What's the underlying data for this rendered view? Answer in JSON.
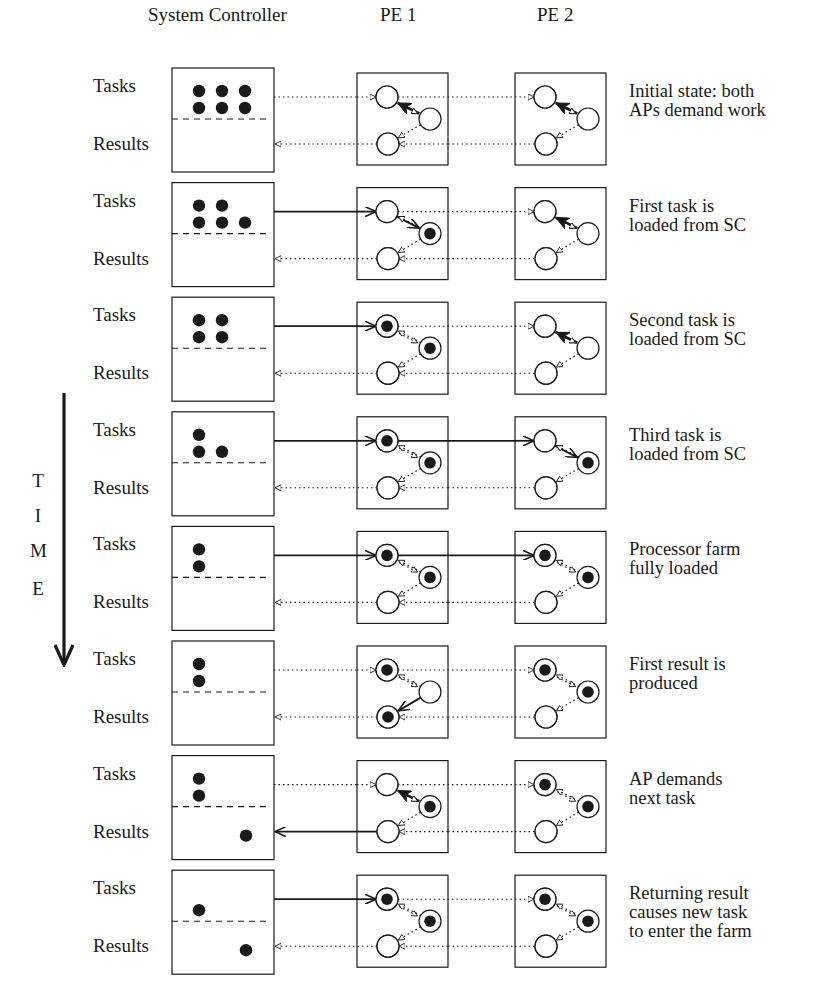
{
  "headers": {
    "system_controller": "System Controller",
    "pe1": "PE 1",
    "pe2": "PE 2"
  },
  "labels": {
    "tasks": "Tasks",
    "results": "Results"
  },
  "time_axis": {
    "letters": [
      "T",
      "I",
      "M",
      "E"
    ]
  },
  "colors": {
    "ink": "#1a1a1a",
    "background": "#ffffff"
  },
  "rows": [
    {
      "description": "Initial state: both\nAPs demand work",
      "sc_tasks": [
        [
          0,
          0
        ],
        [
          1,
          0
        ],
        [
          2,
          0
        ],
        [
          0,
          1
        ],
        [
          1,
          1
        ],
        [
          2,
          1
        ]
      ],
      "sc_results": [],
      "task_link": "dotted-pe1",
      "task_link_pe2": false,
      "result_link": "dotted",
      "pe1": {
        "in": "empty",
        "work": "empty",
        "out": "empty",
        "flow": "work-to-in"
      },
      "pe2": {
        "in": "empty",
        "work": "empty",
        "out": "empty",
        "flow": "work-to-in"
      }
    },
    {
      "description": "First task is\nloaded from SC",
      "sc_tasks": [
        [
          0,
          0
        ],
        [
          1,
          0
        ],
        [
          0,
          1
        ],
        [
          1,
          1
        ],
        [
          2,
          1
        ]
      ],
      "sc_results": [],
      "task_link": "solid-pe1",
      "task_link_pe2": false,
      "result_link": "dotted",
      "pe1": {
        "in": "empty",
        "work": "full",
        "out": "empty",
        "flow": "in-to-work"
      },
      "pe2": {
        "in": "empty",
        "work": "empty",
        "out": "empty",
        "flow": "work-to-in"
      }
    },
    {
      "description": "Second task is\nloaded from SC",
      "sc_tasks": [
        [
          0,
          0
        ],
        [
          1,
          0
        ],
        [
          0,
          1
        ],
        [
          1,
          1
        ]
      ],
      "sc_results": [],
      "task_link": "solid-pe1",
      "task_link_pe2": false,
      "result_link": "dotted",
      "pe1": {
        "in": "full",
        "work": "full",
        "out": "empty",
        "flow": "none"
      },
      "pe2": {
        "in": "empty",
        "work": "empty",
        "out": "empty",
        "flow": "work-to-in"
      }
    },
    {
      "description": "Third task is\nloaded from SC",
      "sc_tasks": [
        [
          0,
          0
        ],
        [
          0,
          1
        ],
        [
          1,
          1
        ]
      ],
      "sc_results": [],
      "task_link": "solid-pe1",
      "task_link_pe2": true,
      "result_link": "dotted",
      "pe1": {
        "in": "full",
        "work": "full",
        "out": "empty",
        "flow": "none"
      },
      "pe2": {
        "in": "empty",
        "work": "full",
        "out": "empty",
        "flow": "in-to-work"
      }
    },
    {
      "description": "Processor farm\nfully loaded",
      "sc_tasks": [
        [
          0,
          0
        ],
        [
          0,
          1
        ]
      ],
      "sc_results": [],
      "task_link": "solid-pe1",
      "task_link_pe2": true,
      "result_link": "dotted",
      "pe1": {
        "in": "full",
        "work": "full",
        "out": "empty",
        "flow": "none"
      },
      "pe2": {
        "in": "full",
        "work": "full",
        "out": "empty",
        "flow": "none"
      }
    },
    {
      "description": "First result is\nproduced",
      "sc_tasks": [
        [
          0,
          0
        ],
        [
          0,
          1
        ]
      ],
      "sc_results": [],
      "task_link": "dotted-pe1",
      "task_link_pe2": false,
      "result_link": "dotted",
      "pe1": {
        "in": "full",
        "work": "empty",
        "out": "full",
        "flow": "work-to-out"
      },
      "pe2": {
        "in": "full",
        "work": "full",
        "out": "empty",
        "flow": "none"
      }
    },
    {
      "description": "AP demands\nnext task",
      "sc_tasks": [
        [
          0,
          0
        ],
        [
          0,
          1
        ]
      ],
      "sc_results": [
        [
          2,
          0
        ]
      ],
      "task_link": "dotted-pe1",
      "task_link_pe2": false,
      "result_link": "solid",
      "pe1": {
        "in": "empty",
        "work": "full",
        "out": "empty",
        "flow": "work-to-in"
      },
      "pe2": {
        "in": "full",
        "work": "full",
        "out": "empty",
        "flow": "none"
      }
    },
    {
      "description": "Returning result\ncauses new task\nto enter the farm",
      "sc_tasks": [
        [
          0,
          1
        ]
      ],
      "sc_results": [
        [
          2,
          0
        ]
      ],
      "task_link": "solid-pe1",
      "task_link_pe2": false,
      "result_link": "dotted",
      "pe1": {
        "in": "full",
        "work": "full",
        "out": "empty",
        "flow": "none"
      },
      "pe2": {
        "in": "full",
        "work": "full",
        "out": "empty",
        "flow": "none"
      }
    }
  ]
}
